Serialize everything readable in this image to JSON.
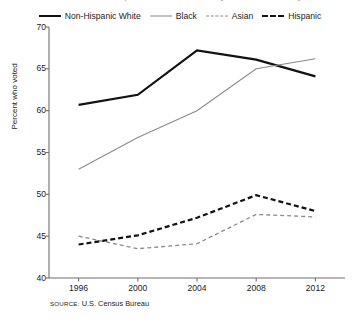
{
  "figure": {
    "clipped_title": "Voter turnout in presidential elections by race and ethnicity",
    "source_keyword": "SOURCE:",
    "source_text": "U.S. Census Bureau"
  },
  "legend": {
    "entries": [
      {
        "label": "Non-Hispanic White",
        "style": "thick-solid-black",
        "color": "#121212"
      },
      {
        "label": "Black",
        "style": "thin-solid-gray",
        "color": "#8a8a8a"
      },
      {
        "label": "Asian",
        "style": "thin-dashed-gray",
        "color": "#8a8a8a"
      },
      {
        "label": "Hispanic",
        "style": "thick-dashed-black",
        "color": "#121212"
      }
    ]
  },
  "chart_data": {
    "type": "line",
    "title": "",
    "xlabel": "",
    "ylabel": "Percent who voted",
    "x": [
      1996,
      2000,
      2004,
      2008,
      2012
    ],
    "categories": [
      "1996",
      "2000",
      "2004",
      "2008",
      "2012"
    ],
    "xlim": [
      1994,
      2014
    ],
    "ylim": [
      40,
      70
    ],
    "yticks": [
      40,
      45,
      50,
      55,
      60,
      65,
      70
    ],
    "ytick_labels": [
      "40",
      "45",
      "50",
      "55",
      "60",
      "65",
      "70"
    ],
    "xticks": [
      1996,
      2000,
      2004,
      2008,
      2012
    ],
    "xtick_labels": [
      "1996",
      "2000",
      "2004",
      "2008",
      "2012"
    ],
    "grid": false,
    "legend_position": "above-top-center",
    "series": [
      {
        "name": "Non-Hispanic White",
        "values": [
          60.7,
          61.9,
          67.2,
          66.1,
          64.1
        ],
        "color": "#121212",
        "width": 2.2,
        "dash": "solid"
      },
      {
        "name": "Black",
        "values": [
          53.0,
          56.8,
          60.0,
          65.0,
          66.2
        ],
        "color": "#8a8a8a",
        "width": 1.1,
        "dash": "solid"
      },
      {
        "name": "Asian",
        "values": [
          45.0,
          43.5,
          44.1,
          47.6,
          47.3
        ],
        "color": "#8a8a8a",
        "width": 1.3,
        "dash": "dashed"
      },
      {
        "name": "Hispanic",
        "values": [
          44.0,
          45.1,
          47.2,
          49.9,
          48.0
        ],
        "color": "#121212",
        "width": 2.2,
        "dash": "dashed"
      }
    ]
  },
  "plot_geometry": {
    "left": 49,
    "right": 345,
    "top": 27,
    "bottom": 278
  }
}
